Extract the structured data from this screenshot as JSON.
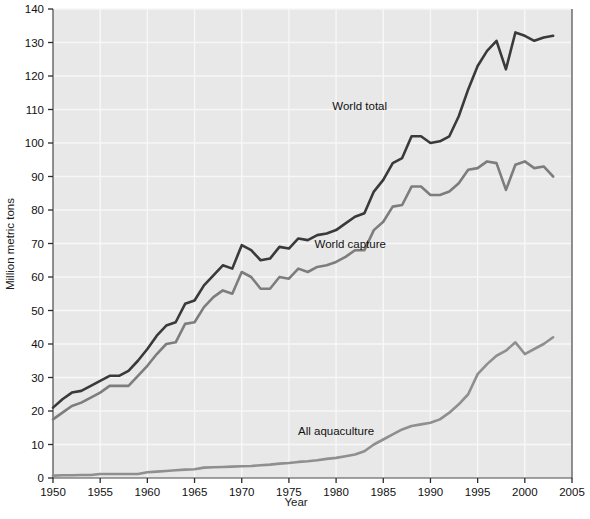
{
  "chart_data": {
    "type": "line",
    "title": "",
    "xlabel": "Year",
    "ylabel": "Million metric tons",
    "xlim": [
      1950,
      2005
    ],
    "ylim": [
      0,
      140
    ],
    "xticks": [
      1950,
      1955,
      1960,
      1965,
      1970,
      1975,
      1980,
      1985,
      1990,
      1995,
      2000,
      2005
    ],
    "yticks": [
      0,
      10,
      20,
      30,
      40,
      50,
      60,
      70,
      80,
      90,
      100,
      110,
      120,
      130,
      140
    ],
    "grid": true,
    "legend_position": "inline-annotations",
    "plot_bg": "#e8e8e8",
    "grid_color": "#f7f7f7",
    "x": [
      1950,
      1951,
      1952,
      1953,
      1954,
      1955,
      1956,
      1957,
      1958,
      1959,
      1960,
      1961,
      1962,
      1963,
      1964,
      1965,
      1966,
      1967,
      1968,
      1969,
      1970,
      1971,
      1972,
      1973,
      1974,
      1975,
      1976,
      1977,
      1978,
      1979,
      1980,
      1981,
      1982,
      1983,
      1984,
      1985,
      1986,
      1987,
      1988,
      1989,
      1990,
      1991,
      1992,
      1993,
      1994,
      1995,
      1996,
      1997,
      1998,
      1999,
      2000,
      2001,
      2002,
      2003
    ],
    "series": [
      {
        "name": "World total",
        "color": "#3a3a3a",
        "width": 2.6,
        "label_text": "World total",
        "label_x": 1982.5,
        "label_y": 111,
        "values": [
          21.0,
          23.5,
          25.5,
          26.0,
          27.5,
          29.0,
          30.5,
          30.5,
          32.0,
          35.0,
          38.5,
          42.5,
          45.5,
          46.5,
          52.0,
          53.0,
          57.5,
          60.5,
          63.5,
          62.5,
          69.5,
          68.0,
          65.0,
          65.5,
          69.0,
          68.5,
          71.5,
          71.0,
          72.5,
          73.0,
          74.0,
          76.0,
          78.0,
          79.0,
          85.5,
          89.0,
          94.0,
          95.5,
          102.0,
          102.0,
          100.0,
          100.5,
          102.0,
          108.0,
          116.0,
          123.0,
          127.5,
          130.5,
          122.0,
          133.0,
          132.0,
          130.5,
          131.5,
          132.0
        ]
      },
      {
        "name": "World capture",
        "color": "#7d7d7d",
        "width": 2.6,
        "label_text": "World capture",
        "label_x": 1981.5,
        "label_y": 70,
        "values": [
          17.5,
          19.5,
          21.5,
          22.5,
          24.0,
          25.5,
          27.5,
          27.5,
          27.5,
          30.5,
          33.5,
          37.0,
          40.0,
          40.5,
          46.0,
          46.5,
          51.0,
          54.0,
          56.0,
          55.0,
          61.5,
          60.0,
          56.5,
          56.5,
          60.0,
          59.5,
          62.5,
          61.5,
          63.0,
          63.5,
          64.5,
          66.0,
          68.0,
          68.0,
          74.0,
          76.5,
          81.0,
          81.5,
          87.0,
          87.0,
          84.5,
          84.5,
          85.5,
          88.0,
          92.0,
          92.5,
          94.5,
          94.0,
          86.0,
          93.5,
          94.5,
          92.5,
          93.0,
          90.0
        ]
      },
      {
        "name": "All aquaculture",
        "color": "#8f8f8f",
        "width": 2.6,
        "label_text": "All aquaculture",
        "label_x": 1980,
        "label_y": 14,
        "values": [
          0.7,
          0.8,
          0.8,
          0.9,
          0.9,
          1.2,
          1.2,
          1.2,
          1.2,
          1.2,
          1.7,
          1.9,
          2.1,
          2.3,
          2.5,
          2.6,
          3.1,
          3.2,
          3.3,
          3.4,
          3.5,
          3.6,
          3.8,
          4.0,
          4.3,
          4.5,
          4.8,
          5.0,
          5.3,
          5.7,
          6.0,
          6.5,
          7.0,
          8.0,
          10.0,
          11.5,
          13.0,
          14.5,
          15.5,
          16.0,
          16.5,
          17.5,
          19.5,
          22.0,
          25.0,
          31.0,
          34.0,
          36.5,
          38.0,
          40.5,
          37.0,
          38.5,
          40.0,
          42.0
        ]
      }
    ]
  }
}
